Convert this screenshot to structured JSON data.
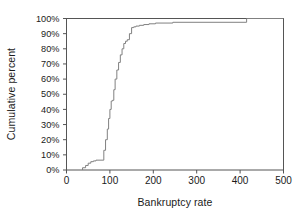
{
  "chart_data": {
    "type": "line",
    "subtype": "step-ecdf",
    "title": "",
    "xlabel": "Bankruptcy rate",
    "ylabel": "Cumulative percent",
    "xlim": [
      0,
      500
    ],
    "ylim": [
      0,
      100
    ],
    "grid": false,
    "legend": null,
    "xticks": [
      0,
      100,
      200,
      300,
      400,
      500
    ],
    "xtick_labels": [
      "0",
      "100",
      "200",
      "300",
      "400",
      "500"
    ],
    "yticks": [
      0,
      10,
      20,
      30,
      40,
      50,
      60,
      70,
      80,
      90,
      100
    ],
    "ytick_labels": [
      "0%",
      "10%",
      "20%",
      "30%",
      "40%",
      "50%",
      "60%",
      "70%",
      "80%",
      "90%",
      "100%"
    ],
    "series": [
      {
        "name": "Cumulative percent",
        "color": "#808080",
        "x": [
          37,
          37,
          44,
          44,
          50,
          50,
          56,
          56,
          62,
          62,
          68,
          68,
          86,
          86,
          90,
          90,
          94,
          94,
          97,
          97,
          100,
          100,
          103,
          103,
          106,
          106,
          109,
          109,
          112,
          112,
          116,
          116,
          120,
          120,
          124,
          124,
          128,
          128,
          132,
          132,
          136,
          136,
          140,
          140,
          145,
          145,
          150,
          150,
          155,
          155,
          160,
          160,
          168,
          168,
          178,
          178,
          190,
          190,
          205,
          205,
          245,
          245,
          415,
          415,
          500
        ],
        "y": [
          0,
          1.5,
          1.5,
          3,
          3,
          4.5,
          4.5,
          5.5,
          5.5,
          6,
          6,
          6.5,
          6.5,
          13,
          13,
          20,
          20,
          27,
          27,
          34,
          34,
          40,
          40,
          45.5,
          45.5,
          46,
          46,
          53,
          53,
          60,
          60,
          66,
          66,
          71,
          71,
          76,
          76,
          80,
          80,
          83.5,
          83.5,
          85,
          85,
          86,
          86,
          90,
          90,
          94,
          94,
          94.5,
          94.5,
          95,
          95,
          95.5,
          95.5,
          96,
          96,
          96.5,
          96.5,
          97,
          97,
          97.5,
          97.5,
          100,
          100
        ]
      }
    ]
  },
  "axes": {
    "frame_color": "#555555",
    "line_color": "#808080"
  }
}
